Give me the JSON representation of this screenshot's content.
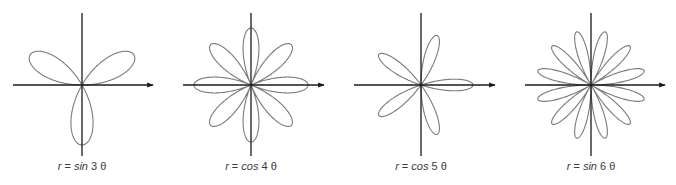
{
  "figures": [
    {
      "caption_var": "r",
      "caption_eq": "=",
      "caption_fn": "sin",
      "caption_n": "3",
      "caption_theta": "θ",
      "func": "sin",
      "n": 3,
      "cx": 82,
      "cy": 85,
      "radius": 60,
      "axis_left": 13,
      "axis_right": 153,
      "axis_top": 13,
      "axis_bottom": 156
    },
    {
      "caption_var": "r",
      "caption_eq": "=",
      "caption_fn": "cos",
      "caption_n": "4",
      "caption_theta": "θ",
      "func": "cos",
      "n": 4,
      "cx": 251,
      "cy": 85,
      "radius": 57,
      "axis_left": 183,
      "axis_right": 324,
      "axis_top": 13,
      "axis_bottom": 156
    },
    {
      "caption_var": "r",
      "caption_eq": "=",
      "caption_fn": "cos",
      "caption_n": "5",
      "caption_theta": "θ",
      "func": "cos",
      "n": 5,
      "cx": 421,
      "cy": 85,
      "radius": 52,
      "axis_left": 354,
      "axis_right": 495,
      "axis_top": 13,
      "axis_bottom": 156
    },
    {
      "caption_var": "r",
      "caption_eq": "=",
      "caption_fn": "sin",
      "caption_n": "6",
      "caption_theta": "θ",
      "func": "sin",
      "n": 6,
      "cx": 591,
      "cy": 85,
      "radius": 55,
      "axis_left": 525,
      "axis_right": 665,
      "axis_top": 13,
      "axis_bottom": 156
    }
  ],
  "colors": {
    "curve": "#7a7a7a",
    "axis": "#1a1a1a",
    "caption": "#3a3a3a"
  },
  "chart_data": [
    {
      "type": "line",
      "title": "r = sin 3θ",
      "equation": "r = sin(3θ)",
      "petals": 3,
      "xlabel": "",
      "ylabel": "",
      "grid": false
    },
    {
      "type": "line",
      "title": "r = cos 4θ",
      "equation": "r = cos(4θ)",
      "petals": 8,
      "xlabel": "",
      "ylabel": "",
      "grid": false
    },
    {
      "type": "line",
      "title": "r = cos 5θ",
      "equation": "r = cos(5θ)",
      "petals": 5,
      "xlabel": "",
      "ylabel": "",
      "grid": false
    },
    {
      "type": "line",
      "title": "r = sin 6θ",
      "equation": "r = sin(6θ)",
      "petals": 12,
      "xlabel": "",
      "ylabel": "",
      "grid": false
    }
  ]
}
